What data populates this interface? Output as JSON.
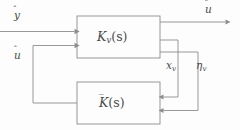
{
  "diagram": {
    "type": "control-block-diagram",
    "background_color": "#fdfdfd",
    "line_color": "#8d8d8d",
    "text_color": "#4a4a4a",
    "blocks": [
      {
        "id": "kv",
        "label": "K_v(s)",
        "base": "K",
        "subscript": "v",
        "argument": "(s)",
        "accent": "none",
        "x": 77,
        "y": 16,
        "width": 83,
        "height": 42
      },
      {
        "id": "kbar",
        "label": "K̄(s)",
        "base": "K",
        "subscript": "",
        "argument": "(s)",
        "accent": "bar",
        "x": 77,
        "y": 82,
        "width": 83,
        "height": 42
      }
    ],
    "signals": [
      {
        "id": "y-hat-input",
        "label": "y",
        "accent": "hat",
        "role": "input",
        "position": "top-left"
      },
      {
        "id": "u-hat-output",
        "label": "u",
        "accent": "hat",
        "role": "output",
        "position": "top-right"
      },
      {
        "id": "u-hat-feedback",
        "label": "u",
        "accent": "hat",
        "role": "feedback",
        "position": "mid-left"
      },
      {
        "id": "xv-signal",
        "label": "x",
        "accent": "none",
        "subscript": "v",
        "role": "internal",
        "position": "mid-right"
      },
      {
        "id": "eta-v-signal",
        "label": "η",
        "accent": "none",
        "subscript": "v",
        "role": "internal",
        "position": "mid-right"
      }
    ]
  }
}
